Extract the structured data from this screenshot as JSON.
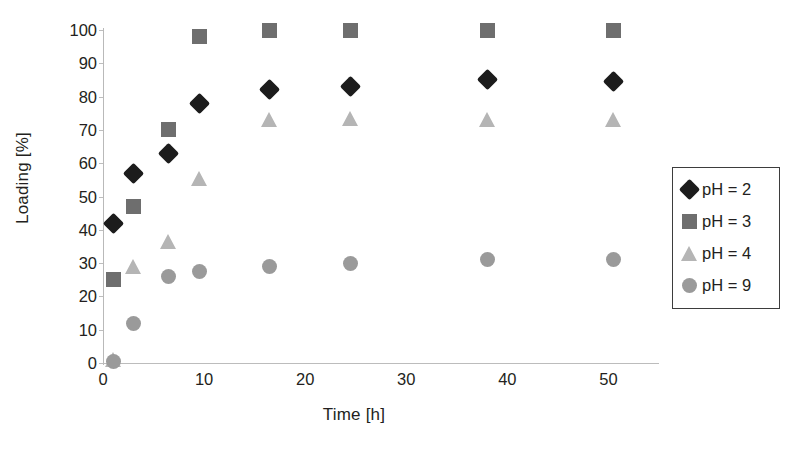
{
  "chart_data": {
    "type": "scatter",
    "title": "",
    "xlabel": "Time [h]",
    "ylabel": "Loading [%]",
    "xlim": [
      0,
      55
    ],
    "ylim": [
      0,
      100
    ],
    "grid": false,
    "legend_position": "right",
    "x_ticks": [
      0,
      10,
      20,
      30,
      40,
      50
    ],
    "y_ticks": [
      0,
      10,
      20,
      30,
      40,
      50,
      60,
      70,
      80,
      90,
      100
    ],
    "x": [
      1,
      3,
      6.5,
      9.5,
      16.5,
      24.5,
      38,
      50.5
    ],
    "series": [
      {
        "name": "pH = 2",
        "marker": "diamond",
        "color": "#1c1c1c",
        "values": [
          42,
          57,
          63,
          78,
          82,
          83,
          85,
          84.5
        ]
      },
      {
        "name": "pH = 3",
        "marker": "square",
        "color": "#6e6e6e",
        "values": [
          25,
          47,
          70,
          98,
          100,
          100,
          100,
          100
        ]
      },
      {
        "name": "pH = 4",
        "marker": "triangle",
        "color": "#b5b5b5",
        "values": [
          1,
          29,
          36.5,
          55.5,
          73,
          73.5,
          73,
          73
        ]
      },
      {
        "name": "pH = 9",
        "marker": "circle",
        "color": "#9a9a9a",
        "values": [
          0.5,
          12,
          26,
          27.5,
          29,
          30,
          31,
          31
        ]
      }
    ]
  },
  "axis": {
    "y_title": "Loading [%]",
    "x_title": "Time [h]"
  },
  "legend": {
    "entries": [
      {
        "label": "pH = 2",
        "marker": "diamond-icon"
      },
      {
        "label": "pH = 3",
        "marker": "square-icon"
      },
      {
        "label": "pH = 4",
        "marker": "triangle-icon"
      },
      {
        "label": "pH = 9",
        "marker": "circle-icon"
      }
    ]
  }
}
